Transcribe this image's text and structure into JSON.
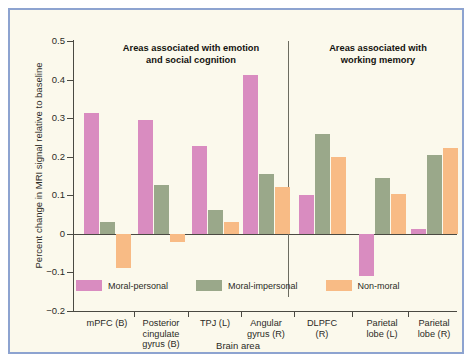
{
  "figure": {
    "background_color": "#fbf9ec",
    "border_color": "#8da3d0"
  },
  "panels": {
    "left_title": "Areas associated with emotion and social cognition",
    "left_title_line1": "Areas associated with emotion",
    "left_title_line2": "and social cognition",
    "right_title": "Areas associated with working memory",
    "right_title_line1": "Areas associated with",
    "right_title_line2": "working memory"
  },
  "chart_data": {
    "type": "bar",
    "title": "",
    "xlabel": "Brain area",
    "ylabel": "Percent change in MRI signal relative to baseline",
    "ylim": [
      -0.2,
      0.5
    ],
    "yticks": [
      0.5,
      0.4,
      0.3,
      0.2,
      0.1,
      0,
      -0.1,
      -0.2
    ],
    "ytick_labels": [
      "0.5",
      "0.4",
      "0.3",
      "0.2",
      "0.1",
      "0",
      "−0.1",
      "−0.2"
    ],
    "grid": false,
    "legend_position": "inside-bottom-left",
    "categories": [
      "mPFC (B)",
      "Posterior cingulate gyrus (B)",
      "TPJ (L)",
      "Angular gyrus (R)",
      "DLPFC (R)",
      "Parietal lobe (L)",
      "Parietal lobe (R)"
    ],
    "category_label_lines": [
      [
        "mPFC (B)"
      ],
      [
        "Posterior",
        "cingulate",
        "gyrus (B)"
      ],
      [
        "TPJ (L)"
      ],
      [
        "Angular",
        "gyrus (R)"
      ],
      [
        "DLPFC",
        "(R)"
      ],
      [
        "Parietal",
        "lobe (L)"
      ],
      [
        "Parietal",
        "lobe (R)"
      ]
    ],
    "series": [
      {
        "name": "Moral-personal",
        "color": "#d98cc0",
        "values": [
          0.313,
          0.295,
          0.228,
          0.412,
          0.101,
          -0.11,
          0.013
        ]
      },
      {
        "name": "Moral-impersonal",
        "color": "#9aa88a",
        "values": [
          0.03,
          0.127,
          0.062,
          0.155,
          0.258,
          0.146,
          0.204
        ]
      },
      {
        "name": "Non-moral",
        "color": "#f8bb85",
        "values": [
          -0.088,
          -0.022,
          0.031,
          0.121,
          0.199,
          0.103,
          0.223
        ]
      }
    ],
    "annotations": [
      "Areas associated with emotion and social cognition",
      "Areas associated with working memory"
    ]
  }
}
